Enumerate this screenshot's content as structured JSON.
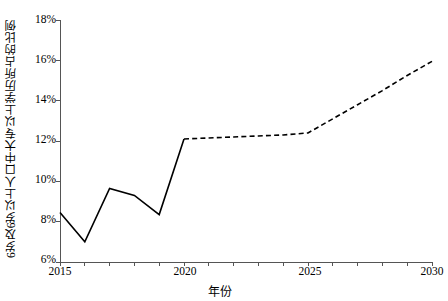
{
  "chart_data": {
    "type": "line",
    "title": "",
    "xlabel": "年份",
    "ylabel": "6岁及6岁以上人口中大专以上学历所占的比例",
    "xlim": [
      2015,
      2030
    ],
    "ylim": [
      6,
      18
    ],
    "grid": false,
    "legend": "none",
    "x_tick_labels": [
      "2015",
      "2020",
      "2025",
      "2030"
    ],
    "x_tick_values": [
      2015,
      2020,
      2025,
      2030
    ],
    "x_minor_ticks": [
      2015,
      2016,
      2017,
      2018,
      2019,
      2020,
      2021,
      2022,
      2023,
      2024,
      2025,
      2026,
      2027,
      2028,
      2029,
      2030
    ],
    "y_tick_labels": [
      "6%",
      "8%",
      "10%",
      "12%",
      "14%",
      "16%",
      "18%"
    ],
    "y_tick_values": [
      6,
      8,
      10,
      12,
      14,
      16,
      18
    ],
    "y_unit": "%",
    "series": [
      {
        "name": "实际值",
        "style": "solid",
        "color": "#000000",
        "x": [
          2015,
          2016,
          2017,
          2018,
          2019,
          2020
        ],
        "values": [
          8.45,
          7.0,
          9.65,
          9.3,
          8.35,
          12.1
        ]
      },
      {
        "name": "预测值",
        "style": "dashed",
        "color": "#000000",
        "x": [
          2020,
          2021,
          2022,
          2023,
          2024,
          2025,
          2026,
          2027,
          2028,
          2029,
          2030
        ],
        "values": [
          12.1,
          12.15,
          12.2,
          12.25,
          12.3,
          12.4,
          13.1,
          13.8,
          14.5,
          15.25,
          15.95
        ]
      }
    ]
  },
  "axis": {
    "y_title": "6岁及6岁以上人口中大专以上学历所占的比例",
    "x_title": "年份"
  },
  "ticks": {
    "y": [
      "18%",
      "16%",
      "14%",
      "12%",
      "10%",
      "8%",
      "6%"
    ],
    "x": [
      "2015",
      "2020",
      "2025",
      "2030"
    ]
  }
}
